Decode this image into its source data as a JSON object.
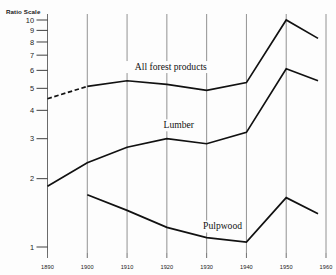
{
  "axis": {
    "y_title": "Ratio Scale",
    "y_tick_labels": [
      "10",
      "9",
      "8",
      "7",
      "6",
      "5",
      "4",
      "3",
      "2",
      "1"
    ],
    "x_tick_labels": [
      "1890",
      "1900",
      "1910",
      "1920",
      "1930",
      "1940",
      "1950",
      "1960"
    ]
  },
  "chart_data": {
    "type": "line",
    "title": "",
    "xlabel": "",
    "ylabel": "Ratio Scale",
    "scale": "log",
    "grid": true,
    "legend": "inline-annotations",
    "xlim": [
      1890,
      1960
    ],
    "ylim": [
      1,
      10
    ],
    "x_ticks": [
      1890,
      1900,
      1910,
      1920,
      1930,
      1940,
      1950,
      1960
    ],
    "y_ticks": [
      1,
      2,
      3,
      4,
      5,
      6,
      7,
      8,
      9,
      10
    ],
    "series": [
      {
        "name": "All forest products",
        "label": "All  forest  products",
        "style": "solid-with-dashed-start",
        "x": [
          1890,
          1900,
          1910,
          1920,
          1930,
          1940,
          1950,
          1958
        ],
        "values": [
          4.5,
          5.1,
          5.4,
          5.2,
          4.9,
          5.3,
          10.0,
          8.3
        ],
        "dashed_segment_x": [
          1890,
          1900
        ]
      },
      {
        "name": "Lumber",
        "label": "Lumber",
        "style": "solid",
        "x": [
          1890,
          1900,
          1910,
          1920,
          1930,
          1940,
          1950,
          1958
        ],
        "values": [
          1.85,
          2.35,
          2.75,
          3.0,
          2.85,
          3.2,
          6.1,
          5.4
        ]
      },
      {
        "name": "Pulpwood",
        "label": "Pulpwood",
        "style": "solid",
        "x": [
          1900,
          1910,
          1920,
          1930,
          1940,
          1950,
          1958
        ],
        "values": [
          1.7,
          1.45,
          1.22,
          1.1,
          1.05,
          1.65,
          1.4
        ]
      }
    ],
    "annotations": [
      {
        "text": "All  forest  products",
        "x": 1921,
        "y": 6.05
      },
      {
        "text": "Lumber",
        "x": 1923,
        "y": 3.35
      },
      {
        "text": "Pulpwood",
        "x": 1934,
        "y": 1.2
      }
    ]
  }
}
